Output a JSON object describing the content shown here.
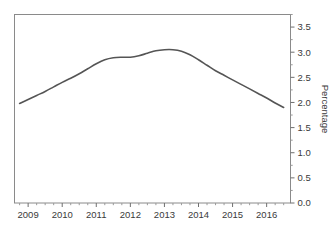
{
  "chart_data": {
    "type": "line",
    "title": "",
    "subtitle": "",
    "xlabel": "",
    "ylabel": "Percentage",
    "legend": [],
    "legend_position": "none",
    "grid": false,
    "xlim": [
      2008.6,
      2016.7
    ],
    "ylim": [
      0.0,
      3.75
    ],
    "x_tick_labels": [
      "2009",
      "2010",
      "2011",
      "2012",
      "2013",
      "2014",
      "2015",
      "2016"
    ],
    "x_tick_values": [
      2009,
      2010,
      2011,
      2012,
      2013,
      2014,
      2015,
      2016
    ],
    "x_minor_tick_interval": 0.25,
    "y_tick_labels": [
      "0.0",
      "0.5",
      "1.0",
      "1.5",
      "2.0",
      "2.5",
      "3.0",
      "3.5"
    ],
    "y_tick_values": [
      0.0,
      0.5,
      1.0,
      1.5,
      2.0,
      2.5,
      3.0,
      3.5
    ],
    "y_axis_side": "right",
    "series": [
      {
        "name": "Percentage",
        "color": "#555555",
        "x": [
          2008.75,
          2009.0,
          2009.25,
          2009.5,
          2009.75,
          2010.0,
          2010.25,
          2010.5,
          2010.75,
          2011.0,
          2011.25,
          2011.5,
          2011.75,
          2012.0,
          2012.25,
          2012.5,
          2012.75,
          2013.0,
          2013.25,
          2013.5,
          2013.75,
          2014.0,
          2014.25,
          2014.5,
          2014.75,
          2015.0,
          2015.25,
          2015.5,
          2015.75,
          2016.0,
          2016.25,
          2016.5
        ],
        "y": [
          1.98,
          2.06,
          2.14,
          2.22,
          2.31,
          2.4,
          2.48,
          2.57,
          2.67,
          2.77,
          2.85,
          2.89,
          2.9,
          2.9,
          2.93,
          2.98,
          3.03,
          3.05,
          3.05,
          3.02,
          2.95,
          2.85,
          2.74,
          2.63,
          2.54,
          2.45,
          2.36,
          2.27,
          2.18,
          2.09,
          1.99,
          1.9
        ]
      }
    ]
  },
  "style": {
    "line_color": "#555555",
    "axis_color": "#8a8a8a",
    "text_color": "#3a3a3a",
    "background": "#ffffff"
  }
}
